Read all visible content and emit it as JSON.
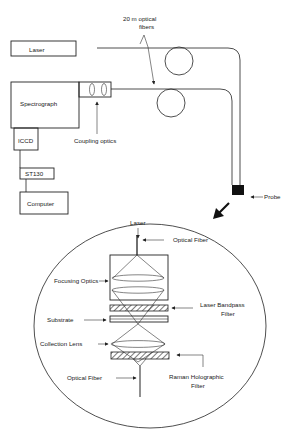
{
  "diagram": {
    "components": {
      "laser": "Laser",
      "spectrograph": "Spectrograph",
      "iccd": "ICCD",
      "st130": "ST130",
      "computer": "Computer",
      "coupling_optics": "Coupling optics",
      "fibers_line1": "20 m optical",
      "fibers_line2": "fibers",
      "probe": "Probe"
    },
    "probe_detail": {
      "laser": "Laser",
      "optical_fiber_top": "Optical Fiber",
      "focusing_optics": "Focusing Optics",
      "laser_bandpass_line1": "Laser Bandpass",
      "laser_bandpass_line2": "Filter",
      "substrate": "Substrate",
      "collection_lens": "Collection Lens",
      "raman_line1": "Raman Holographic",
      "raman_line2": "Filter",
      "optical_fiber_bottom": "Optical Fiber"
    }
  }
}
